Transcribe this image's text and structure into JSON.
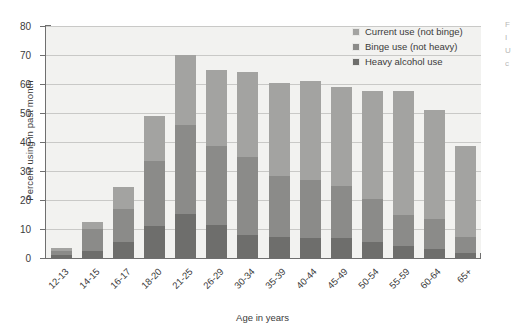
{
  "chart_data": {
    "type": "bar",
    "title": "",
    "xlabel": "Age in years",
    "ylabel": "Percent using in past month",
    "ylim": [
      0,
      80
    ],
    "ytick_step": 10,
    "yticks": [
      0,
      10,
      20,
      30,
      40,
      50,
      60,
      70,
      80
    ],
    "grid": true,
    "stacked": true,
    "legend_position": "top-right",
    "categories": [
      "12-13",
      "14-15",
      "16-17",
      "18-20",
      "21-25",
      "26-29",
      "30-34",
      "35-39",
      "40-44",
      "45-49",
      "50-54",
      "55-59",
      "60-64",
      "65+"
    ],
    "series": [
      {
        "name": "Heavy alcohol use",
        "color": "#6e6e6c",
        "values": [
          1.0,
          2.5,
          5.5,
          11.0,
          15.2,
          11.5,
          8.0,
          7.2,
          7.0,
          7.0,
          5.5,
          4.0,
          3.0,
          1.8
        ]
      },
      {
        "name": "Binge use (not heavy)",
        "color": "#8b8b89",
        "values": [
          1.5,
          7.5,
          11.5,
          22.5,
          30.5,
          27.0,
          27.0,
          21.0,
          19.8,
          18.0,
          15.0,
          11.0,
          10.5,
          5.5
        ]
      },
      {
        "name": "Current use (not binge)",
        "color": "#a3a3a1",
        "values": [
          1.0,
          2.4,
          7.5,
          15.5,
          24.3,
          26.5,
          29.0,
          32.0,
          34.2,
          34.0,
          37.0,
          42.5,
          37.5,
          31.2
        ]
      }
    ],
    "totals": [
      3.5,
      12.4,
      24.5,
      49.0,
      70.0,
      65.0,
      64.0,
      60.2,
      61.0,
      59.0,
      57.5,
      57.5,
      51.0,
      38.5
    ],
    "segment_tops": {
      "heavy": [
        1.0,
        2.5,
        5.5,
        11.0,
        15.2,
        11.5,
        8.0,
        7.2,
        7.0,
        7.0,
        5.5,
        4.0,
        3.0,
        1.8
      ],
      "binge": [
        2.5,
        10.0,
        17.0,
        33.5,
        45.7,
        38.5,
        35.0,
        28.2,
        26.8,
        25.0,
        20.5,
        15.0,
        13.5,
        7.3
      ],
      "current": [
        3.5,
        12.4,
        24.5,
        49.0,
        70.0,
        65.0,
        64.0,
        60.2,
        61.0,
        59.0,
        57.5,
        57.5,
        51.0,
        38.5
      ]
    }
  },
  "legend": {
    "items": [
      {
        "label": "Current use (not binge)",
        "color": "#a3a3a1"
      },
      {
        "label": "Binge use (not heavy)",
        "color": "#8b8b89"
      },
      {
        "label": "Heavy alcohol use",
        "color": "#6e6e6c"
      }
    ]
  },
  "axes": {
    "y_title": "Percent using in past month",
    "x_title": "Age in years"
  },
  "colors": {
    "plot_background": "#f2f2f0",
    "gridline": "#c9c9c7",
    "axis": "#6f6f6f",
    "text": "#3b3b3b"
  }
}
